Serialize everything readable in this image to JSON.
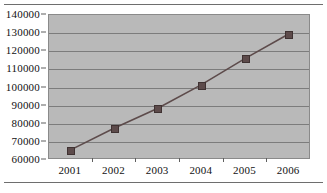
{
  "chart_data": {
    "type": "line",
    "title": "",
    "xlabel": "",
    "ylabel": "",
    "categories": [
      "2001",
      "2002",
      "2003",
      "2004",
      "2005",
      "2006"
    ],
    "values": [
      65000,
      77000,
      88000,
      101000,
      115500,
      129000
    ],
    "series": [
      {
        "name": "",
        "values": [
          65000,
          77000,
          88000,
          101000,
          115500,
          129000
        ]
      }
    ],
    "ylim": [
      60000,
      140000
    ],
    "yticks": [
      60000,
      70000,
      80000,
      90000,
      100000,
      110000,
      120000,
      130000,
      140000
    ],
    "ytick_labels": [
      "60000",
      "70000",
      "80000",
      "90000",
      "100000",
      "110000",
      "120000",
      "130000",
      "140000"
    ],
    "xtick_labels": [
      "2001",
      "2002",
      "2003",
      "2004",
      "2005",
      "2006"
    ],
    "grid": true,
    "legend": false,
    "legend_position": "none",
    "colors": {
      "plot_background": "#b9b9b9",
      "gridline": "#7c7c7c",
      "line": "#5d4b4b",
      "marker": "#5d4b4b",
      "text": "#111111",
      "frame": "#8a8a8a",
      "rule": "#6e6e6e"
    }
  }
}
